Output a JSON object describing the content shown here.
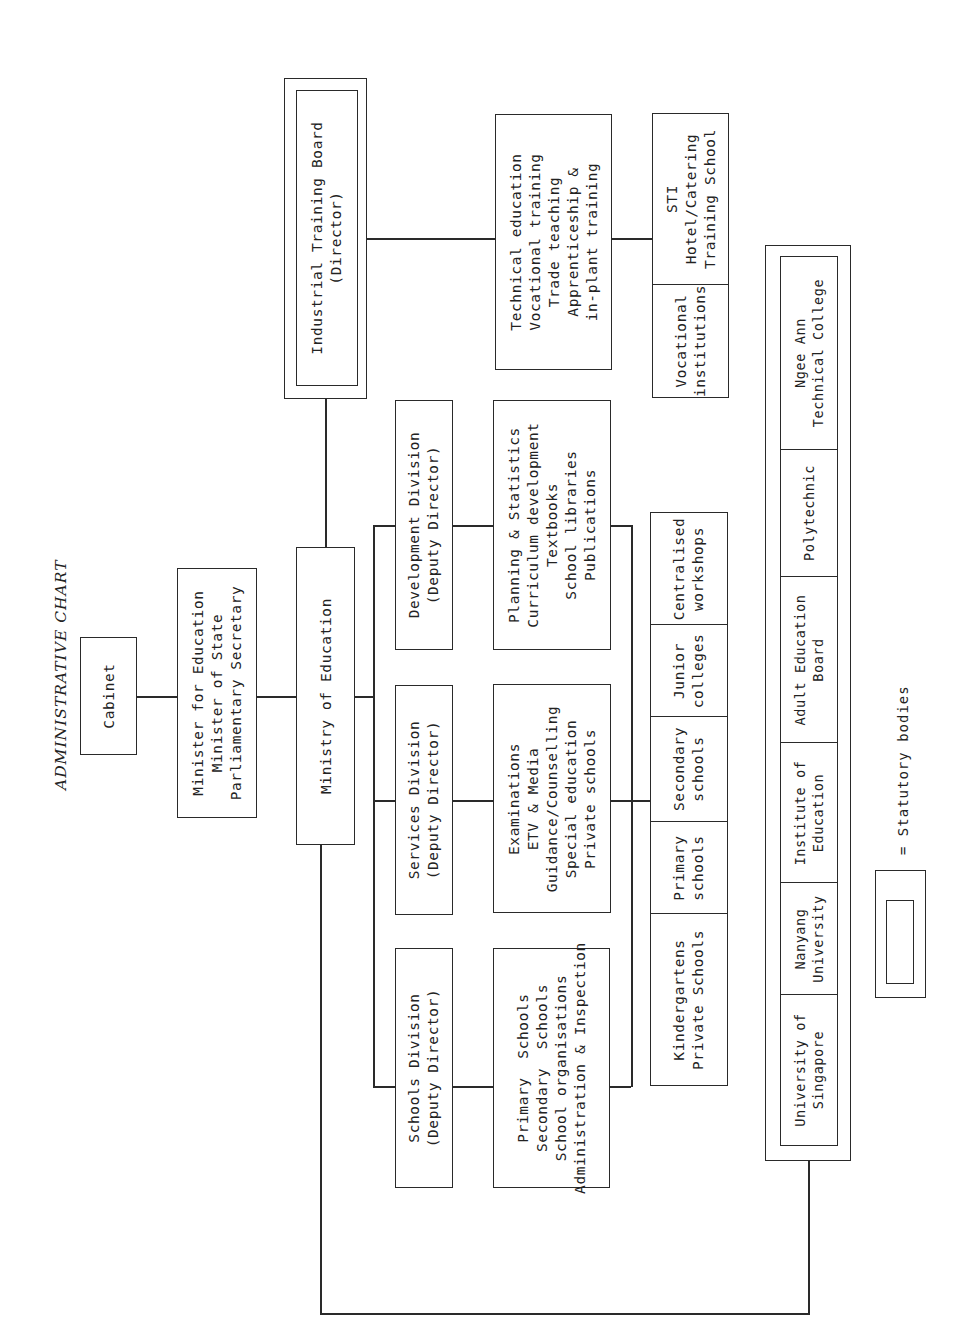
{
  "title": "ADMINISTRATIVE CHART",
  "nodes": {
    "cabinet": "Cabinet",
    "minister": "Minister for Education\nMinister of State\nParliamentary Secretary",
    "ministry": "Ministry of Education",
    "schools_division": "Schools Division\n(Deputy Director)",
    "services_division": "Services Division\n(Deputy Director)",
    "development_division": "Development Division\n(Deputy Director)",
    "industrial_training_board": "Industrial Training Board\n(Director)",
    "schools_functions": "Primary  Schools\nSecondary  Schools\nSchool organisations\nAdministration & Inspection",
    "services_functions": "Examinations\nETV & Media\nGuidance/Counselling\nSpecial education\nPrivate schools",
    "development_functions": "Planning & Statistics\nCurriculum development\nTextbooks\nSchool libraries\nPublications",
    "itb_functions": "Technical education\nVocational training\nTrade teaching\nApprenticeship &\nin-plant training"
  },
  "itb_institutions": [
    {
      "label": "STI\nHotel/Catering\nTraining School"
    },
    {
      "label": "Vocational\ninstitutions"
    }
  ],
  "school_types": [
    {
      "label": "Centralised\nworkshops"
    },
    {
      "label": "Junior\ncolleges"
    },
    {
      "label": "Secondary\nschools"
    },
    {
      "label": "Primary\nschools"
    },
    {
      "label": "Kindergartens\nPrivate Schools"
    }
  ],
  "statutory_bodies": [
    {
      "label": "Ngee Ann\nTechnical College"
    },
    {
      "label": "Polytechnic"
    },
    {
      "label": "Adult Education\nBoard"
    },
    {
      "label": "Institute of\nEducation"
    },
    {
      "label": "Nanyang\nUniversity"
    },
    {
      "label": "University of\nSingapore"
    }
  ],
  "legend": {
    "text": "= Statutory bodies"
  },
  "colors": {
    "ink": "#2a2a2a",
    "paper": "#ffffff"
  }
}
